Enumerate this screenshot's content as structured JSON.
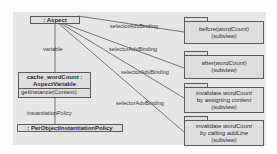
{
  "diagram": {
    "aspect": {
      "label": ": Aspect"
    },
    "variable_box": {
      "line1": "cache_wordCount :",
      "line2": "AspectVariable",
      "operation": "getInstance(Context)"
    },
    "policy": {
      "label": ": PerObjectInstantiationPolicy"
    },
    "edge_labels": {
      "variable": "variable",
      "instantiation": "instantiationPolicy",
      "binding": "selectorAdvBinding"
    },
    "subviews": [
      {
        "pre": "before(",
        "ital": "wordCount",
        "post": ")",
        "extra": "",
        "sub": "(subview)"
      },
      {
        "pre": "after(",
        "ital": "wordCount",
        "post": ")",
        "extra": "",
        "sub": "(subview)"
      },
      {
        "pre": "invalidate ",
        "ital": "wordCount",
        "post": "",
        "extra_pre": "by assigning ",
        "extra_ital": "content",
        "sub": "(subview)"
      },
      {
        "pre": "invalidate ",
        "ital": "wordCount",
        "post": "",
        "extra_pre": "by calling ",
        "extra_ital": "addLine",
        "sub": "(subview)"
      }
    ]
  }
}
